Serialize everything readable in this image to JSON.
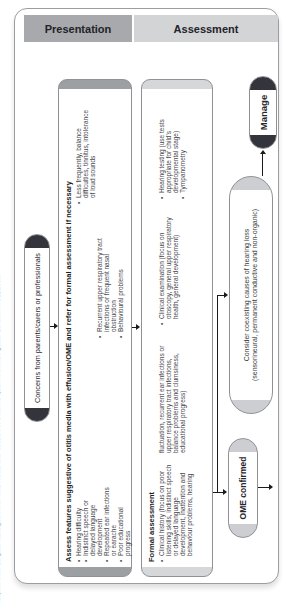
{
  "caption": "Adapted from Surgical management of otitis media with effusion in children: quick reference guide. London: NICE, 2008.",
  "header": {
    "presentation": "Presentation",
    "assessment": "Assessment"
  },
  "flow": {
    "concerns": "Concerns from parents/carers or professionals",
    "assess": {
      "heading": "Assess features suggestive of otitis media with effusion/OME and refer for formal assessment if necessary",
      "col1": [
        "Hearing difficulty",
        "Indistinct speech or delayed language development",
        "Repeated ear infections or earache",
        "Poor educational progress"
      ],
      "col2": [
        "Less frequently, balance difficulties, tinnitus, intolerance of loud sounds",
        "Recurrent upper respiratory tract infections or frequent nasal obstruction",
        "Behavioural problems"
      ]
    },
    "formal": {
      "heading": "Formal assessment",
      "history_part1": "Clinical history (focus on poor listening skills, indistinct speech or delayed language development, inattention and behaviour problems, hearing",
      "history_part2": "fluctuation, recurrent ear infections or upper respiratory tract infections, balance problems and clumsiness, educational progress)",
      "examination": "Clinical examination (focus on otoscopy, general upper respiratory health, general development)",
      "hearing_testing": "Hearing testing (use tests appropriate for child's developmental stage)",
      "tympanometry": "Tympanometry"
    },
    "ome_confirmed": "OME confirmed",
    "consider": {
      "line1": "Consider coexisting causes of hearing loss",
      "line2": "(sensorineural, permanent conductive and non-organic)"
    },
    "manage": "Manage"
  },
  "colors": {
    "presentation_header_bg": "#a7a9ac",
    "assessment_header_bg": "#d3d4d6",
    "dark_cap": "#33343c",
    "medium_cap": "#9da0a3",
    "light_cap": "#cdced1",
    "box_border": "#8f9194",
    "frame_border": "#9b9da0",
    "body_text": "#47474d",
    "line_color": "#1a1a1a"
  }
}
